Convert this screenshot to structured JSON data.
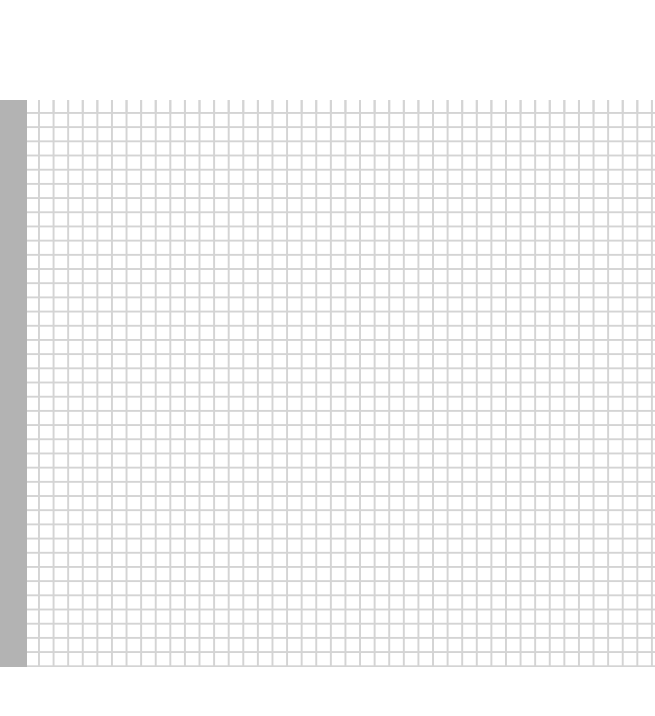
{
  "sheet": {
    "row_header_color": "#b3b3b3",
    "grid_line_color": "#d4d4d4",
    "cells": []
  }
}
